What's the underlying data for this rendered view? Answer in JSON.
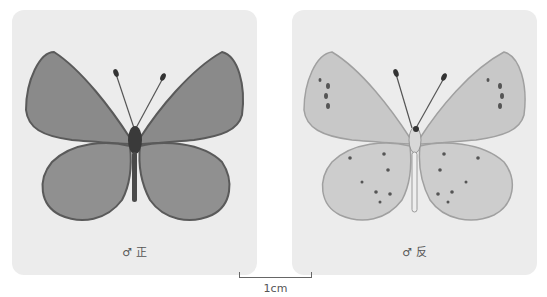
{
  "panels": [
    {
      "id": "upperside",
      "caption": "♂ 正",
      "colors": {
        "wing": "#8a8a8a",
        "wing_edge": "#5a5a5a",
        "body": "#3a3a3a"
      }
    },
    {
      "id": "underside",
      "caption": "♂ 反",
      "colors": {
        "wing": "#c8c8c8",
        "wing_edge": "#a0a0a0",
        "spots": "#444444",
        "body": "#e8e8e8"
      }
    }
  ],
  "scale_bar": {
    "label": "1cm"
  },
  "background": "#ececec"
}
